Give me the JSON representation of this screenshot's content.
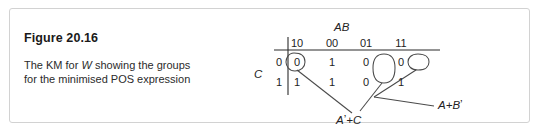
{
  "figure": {
    "number": "Figure 20.16",
    "caption_line1_pre": "The KM for ",
    "caption_line1_var": "W",
    "caption_line1_post": " showing the groups",
    "caption_line2": "for the minimised POS expression"
  },
  "kmap": {
    "column_variable_label": "AB",
    "row_variable_label": "C",
    "column_headers": [
      "10",
      "00",
      "01",
      "11"
    ],
    "row_headers": [
      "0",
      "1"
    ],
    "rows": [
      {
        "header": "0",
        "cells": [
          "0",
          "1",
          "0",
          "0"
        ]
      },
      {
        "header": "1",
        "cells": [
          "1",
          "1",
          "0",
          "1"
        ]
      }
    ],
    "groups": [
      {
        "name": "group-col01-pair",
        "label": "A’+C",
        "label_base": "A",
        "label_prime": "’",
        "label_rest": "+C",
        "cells": [
          "r0c2",
          "r1c2"
        ],
        "shape": "vertical-oval"
      },
      {
        "name": "group-wrap-row0-edges",
        "label": "A+B’",
        "label_base": "A+B",
        "label_prime": "’",
        "label_rest": "",
        "cells": [
          "r0c0",
          "r0c3"
        ],
        "shape": "wrapping-pair"
      }
    ],
    "annotations": [
      {
        "name": "annotation-a-prime-plus-c",
        "text_base": "A",
        "text_prime": "’",
        "text_rest": "+C"
      },
      {
        "name": "annotation-a-plus-b-prime",
        "text_base": "A+B",
        "text_prime": "’",
        "text_rest": ""
      }
    ]
  },
  "colors": {
    "ink": "#232323",
    "heading": "#1a1a1a",
    "border": "#d2d2d2",
    "background": "#ffffff"
  }
}
